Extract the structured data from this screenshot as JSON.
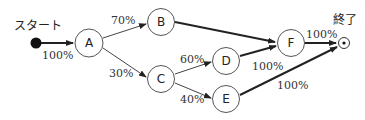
{
  "diagram": {
    "start_label": "スタート",
    "end_label": "終了",
    "nodes": [
      {
        "id": "A",
        "label": "A"
      },
      {
        "id": "B",
        "label": "B"
      },
      {
        "id": "C",
        "label": "C"
      },
      {
        "id": "D",
        "label": "D"
      },
      {
        "id": "E",
        "label": "E"
      },
      {
        "id": "F",
        "label": "F"
      }
    ],
    "edges": [
      {
        "from": "start",
        "to": "A",
        "label": "100%"
      },
      {
        "from": "A",
        "to": "B",
        "label": "70%"
      },
      {
        "from": "A",
        "to": "C",
        "label": "30%"
      },
      {
        "from": "B",
        "to": "F",
        "label": ""
      },
      {
        "from": "C",
        "to": "D",
        "label": "60%"
      },
      {
        "from": "C",
        "to": "E",
        "label": "40%"
      },
      {
        "from": "D",
        "to": "F",
        "label": "100%"
      },
      {
        "from": "F",
        "to": "end",
        "label": "100%"
      },
      {
        "from": "E",
        "to": "end",
        "label": "100%"
      }
    ]
  }
}
